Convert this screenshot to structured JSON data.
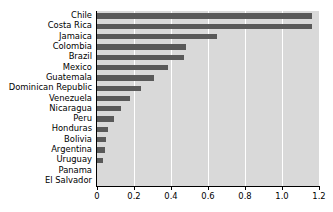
{
  "chart_data": {
    "type": "bar",
    "orientation": "horizontal",
    "title": "",
    "subtitle": "",
    "xlabel": "",
    "ylabel": "",
    "categories": [
      "Chile",
      "Costa Rica",
      "Jamaica",
      "Colombia",
      "Brazil",
      "Mexico",
      "Guatemala",
      "Dominican Republic",
      "Venezuela",
      "Nicaragua",
      "Peru",
      "Honduras",
      "Bolivia",
      "Argentina",
      "Uruguay",
      "Panama",
      "El Salvador"
    ],
    "values": [
      1.16,
      1.16,
      0.65,
      0.48,
      0.47,
      0.385,
      0.31,
      0.24,
      0.18,
      0.13,
      0.09,
      0.06,
      0.05,
      0.045,
      0.035,
      0.0,
      0.0
    ],
    "xlim": [
      0,
      1.2
    ],
    "xticks": [
      0,
      0.2,
      0.4,
      0.6,
      0.8,
      1.0,
      1.2
    ],
    "xtick_labels": [
      "0",
      "0.2",
      "0.4",
      "0.6",
      "0.8",
      "1.0",
      "1.2"
    ],
    "grid": "vertical",
    "legend": "none",
    "colors": {
      "bar": "#595959",
      "plot_background": "#d9d9d9",
      "gridline": "#ffffff",
      "axis": "#000000",
      "text": "#000000",
      "figure_background": "#ffffff"
    }
  }
}
